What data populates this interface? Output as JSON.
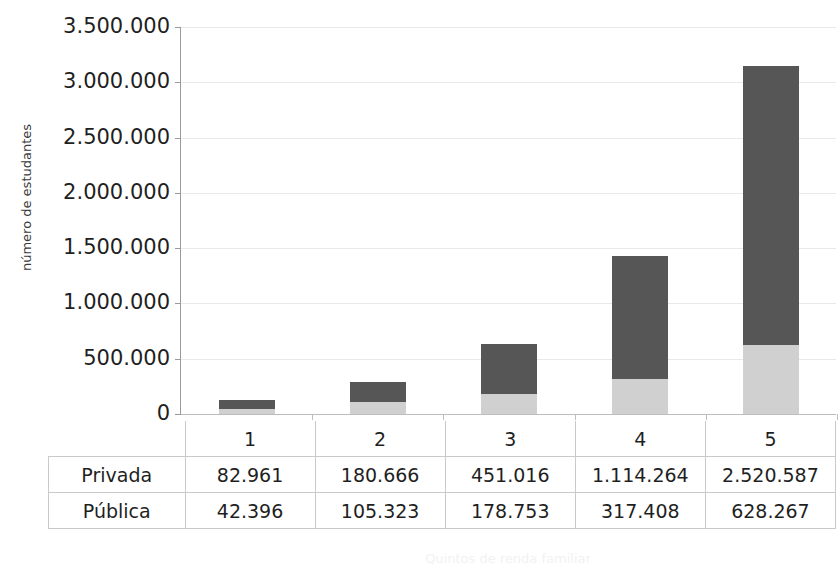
{
  "chart_data": {
    "type": "bar",
    "subtype": "stacked-bar",
    "title": "",
    "xlabel": "Quintos de renda familiar",
    "ylabel": "número de estudantes",
    "categories": [
      "1",
      "2",
      "3",
      "4",
      "5"
    ],
    "series": [
      {
        "name": "Pública",
        "color": "#d0d0d0",
        "values": [
          42396,
          105323,
          178753,
          317408,
          628267
        ],
        "labels": [
          "42.396",
          "105.323",
          "178.753",
          "317.408",
          "628.267"
        ]
      },
      {
        "name": "Privada",
        "color": "#565656",
        "values": [
          82961,
          180666,
          451016,
          1114264,
          2520587
        ],
        "labels": [
          "82.961",
          "180.666",
          "451.016",
          "1.114.264",
          "2.520.587"
        ]
      }
    ],
    "stack_order": [
      "Pública",
      "Privada"
    ],
    "totals": [
      125357,
      285989,
      629769,
      1431672,
      3148854
    ],
    "ylim": [
      0,
      3500000
    ],
    "ytick_values": [
      3500000,
      3000000,
      2500000,
      2000000,
      1500000,
      1000000,
      500000,
      0
    ],
    "ytick_labels": [
      "3.500.000",
      "3.000.000",
      "2.500.000",
      "2.000.000",
      "1.500.000",
      "1.000.000",
      "500.000",
      "0"
    ],
    "grid": true,
    "legend": "none",
    "data_table_visible": true
  },
  "table": {
    "header_cells": [
      "1",
      "2",
      "3",
      "4",
      "5"
    ],
    "rows": [
      {
        "label": "Privada",
        "cells": [
          "82.961",
          "180.666",
          "451.016",
          "1.114.264",
          "2.520.587"
        ]
      },
      {
        "label": "Pública",
        "cells": [
          "42.396",
          "105.323",
          "178.753",
          "317.408",
          "628.267"
        ]
      }
    ]
  }
}
